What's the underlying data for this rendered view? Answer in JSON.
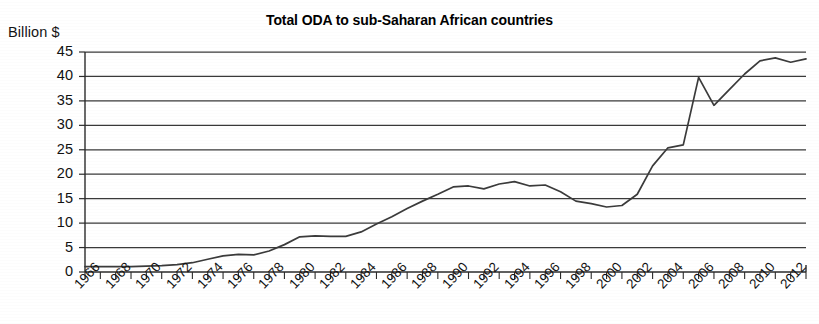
{
  "chart_data": {
    "type": "line",
    "title": "Total ODA to sub-Saharan African countries",
    "ylabel": "Billion $",
    "xlabel": "",
    "ylim": [
      0,
      45
    ],
    "ytick_step": 5,
    "yticks": [
      0,
      5,
      10,
      15,
      20,
      25,
      30,
      35,
      40,
      45
    ],
    "xlim": [
      1966,
      2013
    ],
    "xtick_labels": [
      "1966",
      "1968",
      "1970",
      "1972",
      "1974",
      "1976",
      "1978",
      "1980",
      "1982",
      "1984",
      "1986",
      "1988",
      "1990",
      "1992",
      "1994",
      "1996",
      "1998",
      "2000",
      "2002",
      "2004",
      "2006",
      "2008",
      "2010",
      "2012"
    ],
    "xtick_label_step": 2,
    "minor_tick_step": 1,
    "grid": true,
    "grid_axis": "y",
    "legend": null,
    "line_color": "#3b3b3b",
    "background_color": "#ffffff",
    "x": [
      1966,
      1967,
      1968,
      1969,
      1970,
      1971,
      1972,
      1973,
      1974,
      1975,
      1976,
      1977,
      1978,
      1979,
      1980,
      1981,
      1982,
      1983,
      1984,
      1985,
      1986,
      1987,
      1988,
      1989,
      1990,
      1991,
      1992,
      1993,
      1994,
      1995,
      1996,
      1997,
      1998,
      1999,
      2000,
      2001,
      2002,
      2003,
      2004,
      2005,
      2006,
      2007,
      2008,
      2009,
      2010,
      2011,
      2012,
      2013
    ],
    "values": [
      1.1,
      1.1,
      1.1,
      1.1,
      1.2,
      1.3,
      1.5,
      1.9,
      2.6,
      3.3,
      3.6,
      3.5,
      4.3,
      5.6,
      7.2,
      7.4,
      7.3,
      7.3,
      8.2,
      9.8,
      11.3,
      13.0,
      14.5,
      15.9,
      17.4,
      17.6,
      17.0,
      18.0,
      18.5,
      17.6,
      17.8,
      16.4,
      14.5,
      14.0,
      13.3,
      13.6,
      15.9,
      21.7,
      25.4,
      26.0,
      39.8,
      34.1,
      37.3,
      40.5,
      43.2,
      43.8,
      42.9,
      43.6
    ],
    "series_name": "Total ODA",
    "units": "Billion $",
    "annotations": []
  }
}
